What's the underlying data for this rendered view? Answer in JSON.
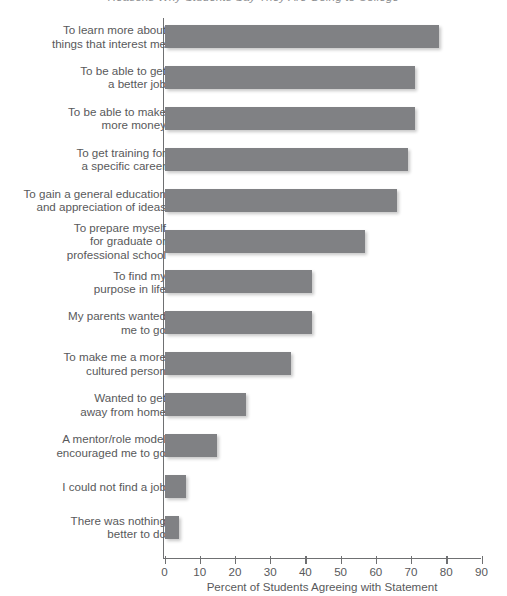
{
  "chart_data": {
    "type": "bar",
    "orientation": "horizontal",
    "title": "Reasons Why Students Say They Are Going to College",
    "xlabel": "Percent of Students Agreeing with Statement",
    "ylabel": "",
    "xlim": [
      0,
      90
    ],
    "xticks": [
      0,
      10,
      20,
      30,
      40,
      50,
      60,
      70,
      80,
      90
    ],
    "grid": false,
    "legend": null,
    "bar_color": "#808184",
    "categories": [
      "To learn more about\nthings that interest me",
      "To be able to get\na better job",
      "To be able to make\nmore money",
      "To get training for\na specific career",
      "To gain a general education\nand appreciation of ideas",
      "To prepare myself\nfor graduate or\nprofessional school",
      "To find my\npurpose in life",
      "My parents wanted\nme to go",
      "To make me a more\ncultured person",
      "Wanted to get\naway from home",
      "A mentor/role model\nencouraged me to go",
      "I could not find a job",
      "There was nothing\nbetter to do"
    ],
    "values": [
      78,
      71,
      71,
      69,
      66,
      57,
      42,
      42,
      36,
      23,
      15,
      6,
      4
    ]
  }
}
